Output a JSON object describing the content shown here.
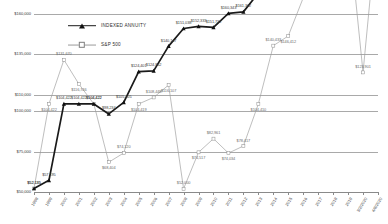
{
  "chart_data": {
    "type": "line",
    "title": "",
    "xlabel": "",
    "ylabel": "",
    "ylim": [
      50000,
      160000
    ],
    "yticks": [
      50000,
      75000,
      100000,
      110000,
      135000,
      160000
    ],
    "ytick_labels": [
      "$50,000",
      "$75,000",
      "$100,000",
      "$110,000",
      "$135,000",
      "$160,000"
    ],
    "grid": true,
    "legend_position": "upper-left-inside",
    "categories": [
      "1998",
      "1999",
      "2000",
      "2001",
      "2002",
      "2003",
      "2004",
      "2005",
      "2006",
      "2007",
      "2008",
      "2009",
      "2010",
      "2011",
      "2012",
      "2013",
      "2014",
      "2015",
      "2016",
      "2017",
      "2018",
      "2019",
      "3/2/2020",
      "4/8/2020"
    ],
    "series": [
      {
        "name": "INDEXED ANNUITY",
        "color": "#1a1a1a",
        "marker": "triangle",
        "values": [
          52135,
          57195,
          104422,
          104422,
          104422,
          98234,
          105405,
          124401,
          124862,
          140147,
          151038,
          152333,
          151732,
          160343,
          161302,
          172950,
          180394,
          200206,
          212944,
          200322,
          217740,
          227500,
          228555,
          220605
        ],
        "labels": [
          "$52,135",
          "$57,195",
          "$104,422",
          "$104,422",
          "$104,422",
          "$98,234",
          "$105,405",
          "$124,401",
          "$124,862",
          "$140,147",
          "$151,038",
          "$152,333",
          "$151,732",
          "$160,343",
          "$161,302",
          "$172,950",
          "$180,394",
          "$200,206",
          "$212,944",
          "$200,322",
          "$217,740",
          "$227,500",
          "$228,555",
          "$220,605"
        ]
      },
      {
        "name": "S&P 500",
        "color": "#9a9a9a",
        "marker": "square",
        "values": [
          52135,
          104422,
          131670,
          116746,
          104422,
          68404,
          74120,
          104419,
          108448,
          116107,
          52000,
          74517,
          82961,
          74034,
          78417,
          104410,
          140433,
          146412,
          170000,
          180000,
          200000,
          215000,
          123901,
          220500
        ],
        "labels": [
          "$52,135",
          "$104,422",
          "$131,670",
          "$116,746",
          "$104,422",
          "$68,404",
          "$74,120",
          "$104,419",
          "$108,448",
          "$116,107",
          "$52,000",
          "$74,517",
          "$82,961",
          "$74,034",
          "$78,417",
          "$104,410",
          "$140,433",
          "$146,412",
          "$170,000",
          "$180,000",
          "$200,000",
          "$215,000",
          "$123,901",
          "$220,500"
        ]
      }
    ]
  },
  "legend": {
    "items": [
      {
        "label": "INDEXED ANNUITY",
        "marker": "triangle-marker"
      },
      {
        "label": "S&P 500",
        "marker": "square-marker"
      }
    ]
  }
}
